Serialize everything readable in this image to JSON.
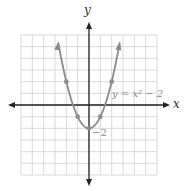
{
  "chart_data": {
    "type": "line",
    "title": "",
    "xlabel": "x",
    "ylabel": "y",
    "xlim": [
      -6,
      6
    ],
    "ylim": [
      -6,
      6
    ],
    "grid": true,
    "series": [
      {
        "name": "y = x^2 - 2",
        "x": [
          -2,
          -1,
          0,
          1,
          2
        ],
        "values": [
          2,
          -1,
          -2,
          -1,
          2
        ],
        "marked_points": [
          [
            -2,
            2
          ],
          [
            -1,
            -1
          ],
          [
            0,
            -2
          ],
          [
            1,
            -1
          ],
          [
            2,
            2
          ]
        ]
      }
    ],
    "annotations": [
      {
        "text": "y = x² − 2",
        "near": [
          2.2,
          0.5
        ]
      },
      {
        "text": "−2",
        "near": [
          0.2,
          -2.5
        ]
      }
    ]
  },
  "labels": {
    "x_axis": "x",
    "y_axis": "y",
    "equation": "y = x² − 2",
    "intercept": "−2"
  },
  "colors": {
    "curve": "#8a8a8a",
    "grid": "#cfcfcf",
    "axis": "#222222"
  }
}
